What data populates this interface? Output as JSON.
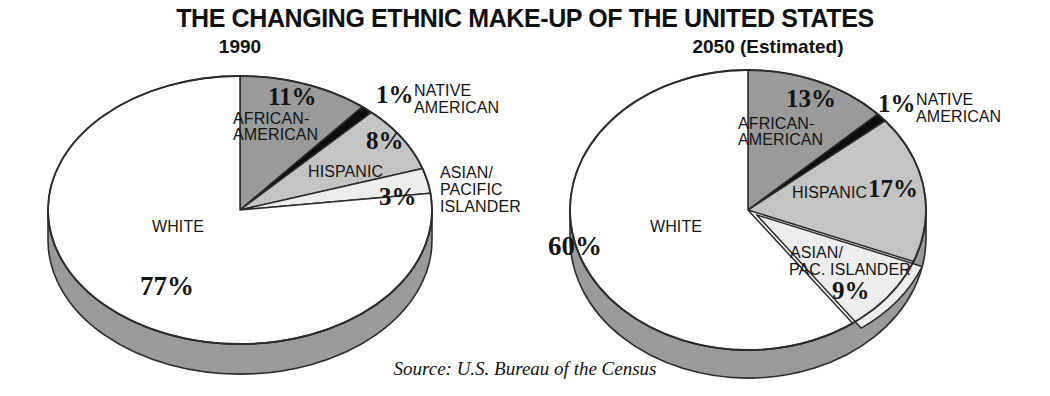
{
  "header": {
    "title": "THE CHANGING ETHNIC MAKE-UP OF THE UNITED STATES",
    "source": "Source: U.S. Bureau of the Census"
  },
  "panels": {
    "left_subtitle": "1990",
    "right_subtitle": "2050 (Estimated)"
  },
  "labels": {
    "left": {
      "african_american_name": "AFRICAN-",
      "african_american_name2": "AMERICAN",
      "african_american_pct": "11%",
      "native_american_pct": "1%",
      "native_american_name": "NATIVE",
      "native_american_name2": "AMERICAN",
      "hispanic_name": "HISPANIC",
      "hispanic_pct": "8%",
      "asian_pct": "3%",
      "asian_name": "ASIAN/",
      "asian_name2": "PACIFIC",
      "asian_name3": "ISLANDER",
      "white_name": "WHITE",
      "white_pct": "77%"
    },
    "right": {
      "african_american_name": "AFRICAN-",
      "african_american_name2": "AMERICAN",
      "african_american_pct": "13%",
      "native_american_pct": "1%",
      "native_american_name": "NATIVE",
      "native_american_name2": "AMERICAN",
      "hispanic_name": "HISPANIC",
      "hispanic_pct": "17%",
      "asian_name": "ASIAN/",
      "asian_name2": "PAC. ISLANDER",
      "asian_pct": "9%",
      "white_name": "WHITE",
      "white_pct": "60%"
    }
  },
  "colors": {
    "white_slice": "#ffffff",
    "african_american_slice": "#9a9a9a",
    "native_american_slice": "#0d0d0d",
    "hispanic_slice": "#c4c4c4",
    "asian_slice": "#ededed",
    "rim": "#9a9a9a",
    "outline": "#2b2b2b",
    "text": "#141414",
    "background": "#ffffff"
  },
  "chart_data": [
    {
      "type": "pie",
      "title": "1990",
      "categories": [
        "WHITE",
        "AFRICAN-AMERICAN",
        "NATIVE AMERICAN",
        "HISPANIC",
        "ASIAN/PACIFIC ISLANDER"
      ],
      "values": [
        77,
        11,
        1,
        8,
        3
      ],
      "unit": "percent",
      "legend": "labels-on-slices",
      "start_angle_deg": 0,
      "direction": "clockwise"
    },
    {
      "type": "pie",
      "title": "2050 (Estimated)",
      "categories": [
        "WHITE",
        "AFRICAN-AMERICAN",
        "NATIVE AMERICAN",
        "HISPANIC",
        "ASIAN/PAC. ISLANDER"
      ],
      "values": [
        60,
        13,
        1,
        17,
        9
      ],
      "unit": "percent",
      "legend": "labels-on-slices",
      "start_angle_deg": 0,
      "direction": "clockwise"
    }
  ],
  "geometry": {
    "left": {
      "cx": 240,
      "cy": 210,
      "rx": 192,
      "ry": 134,
      "depth": 30
    },
    "right": {
      "cx": 748,
      "cy": 210,
      "rx": 178,
      "ry": 140,
      "depth": 28
    }
  }
}
